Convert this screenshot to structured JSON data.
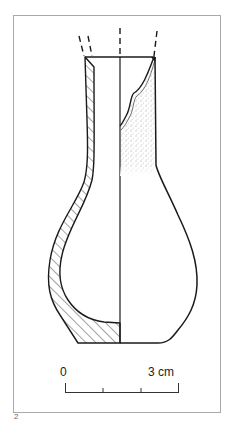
{
  "figure": {
    "number": "2",
    "colors": {
      "line": "#1a1a1a",
      "frame": "#aaaaaa",
      "background": "#ffffff"
    }
  },
  "scale_bar": {
    "start_label": "0",
    "end_label": "3 cm",
    "ticks": 4
  }
}
